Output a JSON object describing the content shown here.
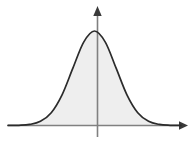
{
  "figure": {
    "background_color": "#ffffff",
    "width": 195,
    "height": 147
  },
  "axes": {
    "x_axis": {
      "label": "",
      "color": "#808080",
      "arrow_color": "#3a3a3a",
      "start_x": 8,
      "end_x": 188,
      "y": 125.5
    },
    "y_axis": {
      "label": "",
      "color": "#808080",
      "arrow_color": "#3a3a3a",
      "x": 97.5,
      "top_y": 6,
      "bottom_y": 137
    }
  },
  "curve": {
    "name": "gaussian-bell-curve",
    "stroke_color": "#2b2b2b",
    "fill_color": "#eeeeee",
    "peak_x": 97.5,
    "peak_y": 31,
    "baseline_y": 125.5,
    "left_tail_x": 8,
    "right_tail_x": 181
  },
  "chart_data": {
    "type": "line",
    "title": "",
    "xlabel": "",
    "ylabel": "",
    "grid": false,
    "legend": null,
    "xlim": [
      -4,
      4
    ],
    "ylim": [
      0,
      1
    ],
    "series": [
      {
        "name": "normal-density",
        "x": [
          -4,
          -3.5,
          -3,
          -2.5,
          -2,
          -1.5,
          -1,
          -0.5,
          0,
          0.5,
          1,
          1.5,
          2,
          2.5,
          3,
          3.5,
          4
        ],
        "values": [
          0.0003,
          0.0022,
          0.0111,
          0.0439,
          0.1353,
          0.3247,
          0.6065,
          0.8825,
          1.0,
          0.8825,
          0.6065,
          0.3247,
          0.1353,
          0.0439,
          0.0111,
          0.0022,
          0.0003
        ]
      }
    ]
  }
}
